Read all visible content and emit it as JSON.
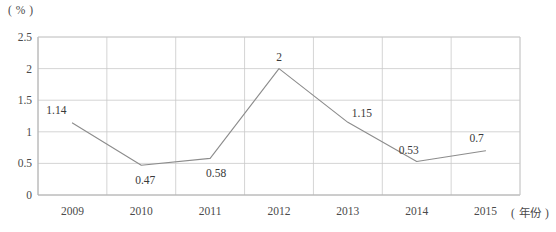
{
  "chart_data": {
    "type": "line",
    "title": "",
    "subtitle": "",
    "xlabel": "( 年份 )",
    "ylabel": "( % )",
    "categories": [
      "2009",
      "2010",
      "2011",
      "2012",
      "2013",
      "2014",
      "2015"
    ],
    "values": [
      1.14,
      0.47,
      0.58,
      2,
      1.15,
      0.53,
      0.7
    ],
    "point_labels": [
      "1.14",
      "0.47",
      "0.58",
      "2",
      "1.15",
      "0.53",
      "0.7"
    ],
    "series": [
      {
        "name": "",
        "values": [
          1.14,
          0.47,
          0.58,
          2,
          1.15,
          0.53,
          0.7
        ]
      }
    ],
    "ylim": [
      0,
      2.5
    ],
    "ytick_values": [
      0,
      0.5,
      1,
      1.5,
      2,
      2.5
    ],
    "ytick_labels": [
      "0",
      "0.5",
      "1",
      "1.5",
      "2",
      "2.5"
    ],
    "grid": "both",
    "legend": "none",
    "colors": {
      "line": "#8c8c8c",
      "grid": "#c9c9c9",
      "axis": "#b0b0b0",
      "text": "#3a3a3a",
      "background": "#ffffff"
    }
  },
  "axis": {
    "y_unit": "( % )",
    "x_title": "( 年份 )"
  },
  "ticks": {
    "y": [
      {
        "label": "2.5",
        "value": 2.5
      },
      {
        "label": "2",
        "value": 2
      },
      {
        "label": "1.5",
        "value": 1.5
      },
      {
        "label": "1",
        "value": 1
      },
      {
        "label": "0.5",
        "value": 0.5
      },
      {
        "label": "0",
        "value": 0
      }
    ],
    "x": [
      {
        "label": "2009"
      },
      {
        "label": "2010"
      },
      {
        "label": "2011"
      },
      {
        "label": "2012"
      },
      {
        "label": "2013"
      },
      {
        "label": "2014"
      },
      {
        "label": "2015"
      }
    ]
  },
  "points": [
    {
      "label": "1.14",
      "year": "2009",
      "value": 1.14
    },
    {
      "label": "0.47",
      "year": "2010",
      "value": 0.47
    },
    {
      "label": "0.58",
      "year": "2011",
      "value": 0.58
    },
    {
      "label": "2",
      "year": "2012",
      "value": 2
    },
    {
      "label": "1.15",
      "year": "2013",
      "value": 1.15
    },
    {
      "label": "0.53",
      "year": "2014",
      "value": 0.53
    },
    {
      "label": "0.7",
      "year": "2015",
      "value": 0.7
    }
  ]
}
